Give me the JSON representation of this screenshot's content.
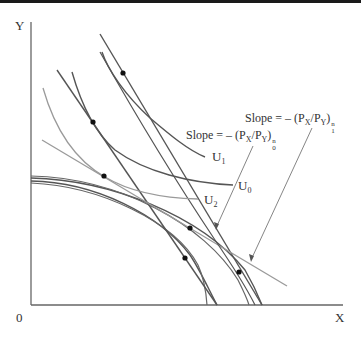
{
  "diagram": {
    "axes": {
      "y_label": "Y",
      "x_label": "X",
      "origin_label": "0"
    },
    "curves": {
      "u1": {
        "label": "U",
        "subscript": "1"
      },
      "u0": {
        "label": "U",
        "subscript": "0"
      },
      "u2": {
        "label": "U",
        "subscript": "2"
      }
    },
    "annotations": {
      "slope1": {
        "prefix": "Slope = – (P",
        "x_sub": "X",
        "mid": "/P",
        "y_sub": "Y",
        "close": ")",
        "sup": "n",
        "sub": "1"
      },
      "slope0": {
        "prefix": "Slope = – (P",
        "x_sub": "X",
        "mid": "/P",
        "y_sub": "Y",
        "close": ")",
        "sup": "n",
        "sub": "0"
      }
    },
    "colors": {
      "dark_line": "#555555",
      "light_line": "#9a9a9a",
      "axis": "#666666",
      "dot": "#111111"
    }
  }
}
